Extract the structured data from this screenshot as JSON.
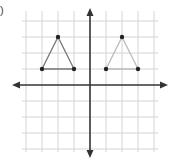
{
  "problem_label": ")",
  "grid": {
    "origin_px": [
      90,
      85
    ],
    "unit_px": 16,
    "x_range": [
      -4,
      4
    ],
    "y_range": [
      -4,
      4
    ],
    "line_color": "#d4d4d4",
    "axis_color": "#333333"
  },
  "axes": {
    "x_arrow_left_px": 12,
    "x_arrow_right_px": 168,
    "y_arrow_top_px": 8,
    "y_arrow_bottom_px": 158
  },
  "shapes": [
    {
      "name": "triangle-left",
      "vertices": [
        [
          -3,
          1
        ],
        [
          -2,
          3
        ],
        [
          -1,
          1
        ]
      ],
      "stroke": "#777777"
    },
    {
      "name": "triangle-right",
      "vertices": [
        [
          1,
          1
        ],
        [
          2,
          3
        ],
        [
          3,
          1
        ]
      ],
      "stroke": "#bbbbbb"
    }
  ]
}
